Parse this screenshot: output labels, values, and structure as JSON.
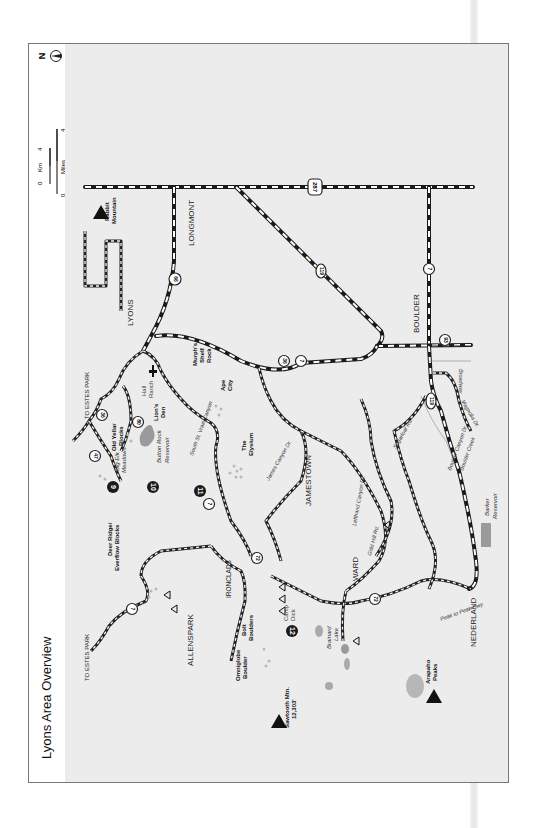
{
  "title": "Lyons Area Overview",
  "scale_bar": {
    "km_start": "0",
    "km_label": "Km",
    "km_end": "4",
    "mi_start": "0",
    "mi_label": "Miles",
    "mi_end": "4"
  },
  "north_arrow": {
    "label": "N"
  },
  "colors": {
    "map_bg": "#ececec",
    "frame": "#777777",
    "road": "#1a1a1a",
    "water": "#999999",
    "badge": "#1a1a1a"
  },
  "towns": {
    "lyons": "LYONS",
    "longmont": "LONGMONT",
    "boulder": "BOULDER",
    "jamestown": "JAMESTOWN",
    "ward": "WARD",
    "allenspark": "ALLENSPARK",
    "nederland": "NEDERLAND",
    "ironclads": "IRONCLADS"
  },
  "directional": {
    "to_estes_park_1": "TO ESTES PARK",
    "to_estes_park_2": "TO ESTES PARK"
  },
  "highways": {
    "us287": "287",
    "co66": "66",
    "co119_north": "119",
    "co7_boulder": "7",
    "co93": "93",
    "co119_canyon": "119",
    "co36": "36",
    "co7_mid": "7",
    "co7_south_st_vrain": "7",
    "co72_north": "72",
    "co72_south": "72",
    "co7_allenspark": "7",
    "co36_north": "36",
    "co80": "80",
    "co47": "47"
  },
  "roads": {
    "broadway": "Broadway",
    "magnolia": "Magnolia Dr.",
    "sugarloaf": "Sugarloaf Rd.",
    "boulder_canyon": "Boulder Canyon Dr.",
    "boulder_creek": "Boulder Creek",
    "gold_hill": "Gold Hill Rd.",
    "lefthand": "Lefthand Canyon Dr.",
    "james_canyon": "James Canyon Dr.",
    "south_st_vrain": "South St. Vrain Canyon",
    "peak_to_peak": "Peak to Peak Hwy"
  },
  "water": {
    "button_rock_1": "Button Rock",
    "button_rock_2": "Reservoir",
    "barker_1": "Barker",
    "barker_2": "Reservoir",
    "brainard_1": "Brainard",
    "brainard_2": "Lake"
  },
  "features": {
    "hall_ranch_1": "Hall",
    "hall_ranch_2": "Ranch",
    "camp_dick_1": "Camp",
    "camp_dick_2": "Dick"
  },
  "peaks": {
    "rabbit_1": "Rabbit",
    "rabbit_2": "Mountain",
    "sawtooth_1": "Sawtooth Mtn.",
    "sawtooth_2": "12,303'",
    "arapaho_1": "Arapaho",
    "arapaho_2": "Peaks"
  },
  "climbing_areas": {
    "murphs_1": "Murph's",
    "murphs_2": "Shelf",
    "murphs_3": "Rock",
    "ape_1": "Ape",
    "ape_2": "City",
    "elysium_1": "The",
    "elysium_2": "Elysium",
    "lions_1": "Lion's",
    "lions_2": "Den",
    "old_yellar_1": "Old Yellar",
    "old_yellar_2": "Blocks",
    "big_elk_1": "Big Elk",
    "big_elk_2": "Meadows",
    "deer_ridge_1": "Deer Ridge/",
    "deer_ridge_2": "Everflow Blocks",
    "bolt_1": "Bolt",
    "bolt_2": "Boulders",
    "omniglobe_1": "Omniglobe",
    "omniglobe_2": "Boulder"
  },
  "numbered_areas": {
    "n9": "9",
    "n10": "10",
    "n11": "11",
    "n12": "12"
  }
}
